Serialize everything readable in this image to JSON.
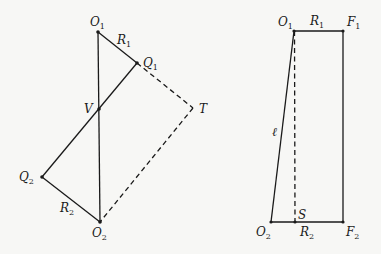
{
  "left_figure": {
    "points": {
      "O1": {
        "label": "O",
        "sub": "1",
        "x": 98,
        "y": 32
      },
      "Q1": {
        "label": "Q",
        "sub": "1",
        "x": 137,
        "y": 63
      },
      "V": {
        "label": "V",
        "sub": "",
        "x": 99,
        "y": 109
      },
      "T": {
        "label": "T",
        "sub": "",
        "x": 193,
        "y": 108
      },
      "Q2": {
        "label": "Q",
        "sub": "2",
        "x": 42,
        "y": 177
      },
      "O2": {
        "label": "O",
        "sub": "2",
        "x": 100,
        "y": 222
      }
    },
    "segment_labels": {
      "R1": {
        "label": "R",
        "sub": "1"
      },
      "R2": {
        "label": "R",
        "sub": "2"
      }
    },
    "solid_segments": [
      [
        "O1",
        "O2"
      ],
      [
        "O1",
        "Q1"
      ],
      [
        "Q1",
        "Q2"
      ],
      [
        "Q2",
        "O2"
      ]
    ],
    "dashed_segments": [
      [
        "Q1",
        "T"
      ],
      [
        "T",
        "O2"
      ]
    ]
  },
  "right_figure": {
    "points": {
      "O1": {
        "label": "O",
        "sub": "1",
        "x": 294,
        "y": 31
      },
      "F1": {
        "label": "F",
        "sub": "1",
        "x": 343,
        "y": 31
      },
      "O2": {
        "label": "O",
        "sub": "2",
        "x": 271,
        "y": 222
      },
      "S": {
        "label": "S",
        "sub": "",
        "x": 295,
        "y": 222
      },
      "F2": {
        "label": "F",
        "sub": "2",
        "x": 343,
        "y": 222
      }
    },
    "segment_labels": {
      "R1": {
        "label": "R",
        "sub": "1"
      },
      "R2": {
        "label": "R",
        "sub": "2"
      },
      "ell": {
        "label": "ℓ"
      }
    },
    "solid_segments": [
      [
        "O1",
        "F1"
      ],
      [
        "F1",
        "F2"
      ],
      [
        "O2",
        "F2"
      ],
      [
        "O1",
        "O2"
      ]
    ],
    "dashed_segments": [
      [
        "O1",
        "S"
      ]
    ]
  }
}
